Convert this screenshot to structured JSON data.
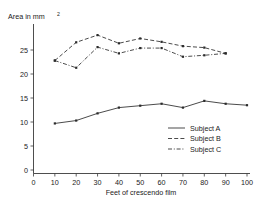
{
  "chart_data": {
    "type": "line",
    "title": "",
    "ylabel": "Area in mm",
    "ylabel_sup": "2",
    "xlabel": "Feet of crescendo film",
    "x": [
      10,
      20,
      30,
      40,
      50,
      60,
      70,
      80,
      90,
      100
    ],
    "xlim": [
      0,
      100
    ],
    "ylim": [
      0,
      29
    ],
    "xticks": [
      0,
      10,
      20,
      30,
      40,
      50,
      60,
      70,
      80,
      90,
      100
    ],
    "yticks": [
      0,
      5,
      10,
      15,
      20,
      25
    ],
    "grid": false,
    "legend_position": "center-right",
    "series": [
      {
        "name": "Subject A",
        "style": "solid",
        "x": [
          10,
          20,
          30,
          40,
          50,
          60,
          70,
          80,
          90,
          100
        ],
        "values": [
          9.7,
          10.3,
          11.8,
          13.0,
          13.4,
          13.8,
          13.0,
          14.4,
          13.8,
          13.5
        ]
      },
      {
        "name": "Subject B",
        "style": "dashed",
        "x": [
          10,
          20,
          30,
          40,
          50,
          60,
          70,
          80,
          90
        ],
        "values": [
          22.8,
          26.6,
          28.1,
          26.4,
          27.4,
          26.7,
          25.8,
          25.5,
          24.3
        ]
      },
      {
        "name": "Subject C",
        "style": "dashdot",
        "x": [
          10,
          20,
          30,
          40,
          50,
          60,
          70,
          80,
          90
        ],
        "values": [
          22.8,
          21.3,
          25.6,
          24.3,
          25.4,
          25.4,
          23.6,
          23.9,
          24.3
        ]
      }
    ]
  },
  "axis": {
    "y_tick_labels": [
      "0",
      "5",
      "10",
      "15",
      "20",
      "25"
    ],
    "x_tick_labels": [
      "0",
      "10",
      "20",
      "30",
      "40",
      "50",
      "60",
      "70",
      "80",
      "90",
      "100"
    ],
    "y_title": "Area in mm",
    "y_title_sup": "2",
    "x_title": "Feet of crescendo film"
  },
  "legend": {
    "items": [
      {
        "label": "Subject A",
        "style": "solid"
      },
      {
        "label": "Subject B",
        "style": "dashed"
      },
      {
        "label": "Subject C",
        "style": "dashdot"
      }
    ]
  },
  "colors": {
    "line": "#2b2b2b",
    "axis": "#3a3a3a",
    "text": "#1a1a1a",
    "background": "#ffffff"
  }
}
